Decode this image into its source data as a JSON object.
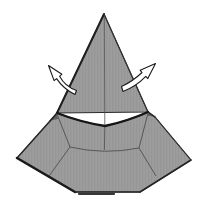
{
  "canvas": {
    "width": 204,
    "height": 205,
    "background": "#ffffff"
  },
  "palette": {
    "paper_gray": "#9d9d9d",
    "paper_gray_stripe": "#959595",
    "edge_dark": "#1b1b1b",
    "edge_medium": "#2b2b2b",
    "crease_gray": "#4f4f4f",
    "arrow_fill": "#ffffff",
    "arrow_stroke": "#1a1a1a"
  },
  "diagram": {
    "shapes": [
      {
        "name": "hat-cone",
        "tag": "path",
        "attrs": {
          "d": "M 104 14 L 57 113 L 148 112 Z",
          "fill": "paper-texture",
          "stroke": "#2b2b2b",
          "stroke-width": "1.1",
          "stroke-linejoin": "round"
        }
      },
      {
        "name": "hat-brim",
        "tag": "path",
        "attrs": {
          "d": "M 57 113 Q 80 122 105 126 Q 128 121 148 112 L 155 117 L 191 160 L 140 192 L 75 192 L 17 158 L 50 121 Z",
          "fill": "paper-texture",
          "stroke": "#2b2b2b",
          "stroke-width": "1.1",
          "stroke-linejoin": "round"
        }
      },
      {
        "name": "brim-crease-left",
        "tag": "path",
        "attrs": {
          "d": "M 57 114 L 70 147",
          "fill": "none",
          "stroke": "#4f4f4f",
          "stroke-width": "0.9"
        }
      },
      {
        "name": "brim-crease-front",
        "tag": "path",
        "attrs": {
          "d": "M 70 147 Q 104 155 139 148",
          "fill": "none",
          "stroke": "#4f4f4f",
          "stroke-width": "0.9"
        }
      },
      {
        "name": "brim-crease-right",
        "tag": "path",
        "attrs": {
          "d": "M 148 113 L 139 148",
          "fill": "none",
          "stroke": "#4f4f4f",
          "stroke-width": "0.9"
        }
      },
      {
        "name": "brim-crease-lower-left",
        "tag": "path",
        "attrs": {
          "d": "M 70 147 L 49 176",
          "fill": "none",
          "stroke": "#4f4f4f",
          "stroke-width": "0.9"
        }
      },
      {
        "name": "brim-crease-lower-right",
        "tag": "path",
        "attrs": {
          "d": "M 139 148 L 156 176",
          "fill": "none",
          "stroke": "#4f4f4f",
          "stroke-width": "0.9"
        }
      },
      {
        "name": "brim-center-crease",
        "tag": "path",
        "attrs": {
          "d": "M 104.8 126 L 104.4 150",
          "fill": "none",
          "stroke": "#555555",
          "stroke-width": "0.9"
        }
      },
      {
        "name": "cone-center-crease",
        "tag": "path",
        "attrs": {
          "d": "M 104.3 16 L 104.8 125",
          "fill": "none",
          "stroke": "#565656",
          "stroke-width": "0.8"
        }
      },
      {
        "name": "cone-left-edge",
        "tag": "path",
        "attrs": {
          "d": "M 104 14 L 57 113",
          "fill": "none",
          "stroke": "#1f1f1f",
          "stroke-width": "2",
          "stroke-linecap": "round"
        }
      },
      {
        "name": "cone-right-edge",
        "tag": "path",
        "attrs": {
          "d": "M 104 14 L 148 112",
          "fill": "none",
          "stroke": "#333333",
          "stroke-width": "1.1",
          "stroke-linecap": "round"
        }
      },
      {
        "name": "brim-top-fold-line",
        "tag": "path",
        "attrs": {
          "d": "M 57 113 Q 80 122 105 126 Q 128 121 148 112",
          "fill": "none",
          "stroke": "#161616",
          "stroke-width": "2.4",
          "stroke-linecap": "round"
        }
      },
      {
        "name": "left-flap-shade",
        "tag": "path",
        "attrs": {
          "d": "M 50.5 120.5 L 57 114 L 58 119 Z",
          "fill": "#606060",
          "stroke": "none"
        }
      },
      {
        "name": "right-flap-shade",
        "tag": "path",
        "attrs": {
          "d": "M 154.5 116.5 L 148 113 L 147.5 115.8 Z",
          "fill": "#606060",
          "stroke": "none"
        }
      },
      {
        "name": "left-flap-edge",
        "tag": "path",
        "attrs": {
          "d": "M 50 121 L 57 113",
          "fill": "none",
          "stroke": "#222222",
          "stroke-width": "1.5",
          "stroke-linecap": "round"
        }
      },
      {
        "name": "right-flap-edge",
        "tag": "path",
        "attrs": {
          "d": "M 155 117 L 148 112",
          "fill": "none",
          "stroke": "#222222",
          "stroke-width": "1.4",
          "stroke-linecap": "round"
        }
      },
      {
        "name": "brim-upper-left-edge",
        "tag": "path",
        "attrs": {
          "d": "M 50 121 L 17 158",
          "fill": "none",
          "stroke": "#2b2b2b",
          "stroke-width": "1.4",
          "stroke-linecap": "round"
        }
      },
      {
        "name": "brim-lower-left-edge",
        "tag": "path",
        "attrs": {
          "d": "M 17 158 L 75 192",
          "fill": "none",
          "stroke": "#1b1b1b",
          "stroke-width": "2.6",
          "stroke-linecap": "round"
        }
      },
      {
        "name": "brim-bottom-edge",
        "tag": "path",
        "attrs": {
          "d": "M 75 192 L 140 192",
          "fill": "none",
          "stroke": "#2b2b2b",
          "stroke-width": "1.3",
          "stroke-linecap": "round"
        }
      },
      {
        "name": "brim-bottom-shadow",
        "tag": "path",
        "attrs": {
          "d": "M 79 193.8 L 114 193.8",
          "fill": "none",
          "stroke": "#383838",
          "stroke-width": "2.2",
          "stroke-linecap": "round"
        }
      },
      {
        "name": "brim-lower-right-edge",
        "tag": "path",
        "attrs": {
          "d": "M 140 192 L 191 160",
          "fill": "none",
          "stroke": "#262626",
          "stroke-width": "1.5",
          "stroke-linecap": "round"
        }
      },
      {
        "name": "brim-upper-right-edge",
        "tag": "path",
        "attrs": {
          "d": "M 191 160 L 155 117",
          "fill": "none",
          "stroke": "#343434",
          "stroke-width": "1.1",
          "stroke-linecap": "round"
        }
      },
      {
        "name": "unfold-arrow-left",
        "tag": "path",
        "attrs": {
          "d": "M 76.5 90.5 Q 65 86.5 59.6 76.3 L 61.9 74.2 L 48.5 65.5 L 54.1 80.6 L 56.6 78.6 Q 63.5 89 75 94.5 Z",
          "fill": "#ffffff",
          "stroke": "#1a1a1a",
          "stroke-width": "1.1",
          "stroke-linejoin": "round"
        }
      },
      {
        "name": "unfold-arrow-right",
        "tag": "path",
        "attrs": {
          "d": "M 121.5 86.5 Q 132.5 81.5 142 72.5 L 140.2 70.3 L 155.5 63.5 L 147.8 78.6 L 145.8 76.4 Q 136 86.5 123 91.5 Z",
          "fill": "#ffffff",
          "stroke": "#1a1a1a",
          "stroke-width": "1.1",
          "stroke-linejoin": "round"
        }
      }
    ]
  }
}
